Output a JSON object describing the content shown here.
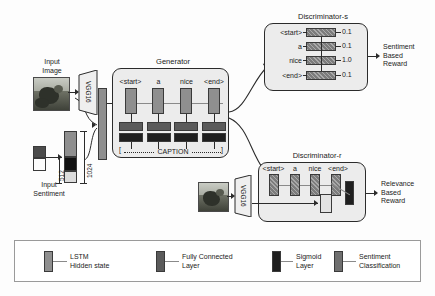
{
  "figure": {
    "background": "#fdfdfd"
  },
  "colors": {
    "lstm": "#8f8f8f",
    "fully_connected": "#5b5b5b",
    "sigmoid": "#1f1f1f",
    "sentiment_classification": "#6f6f6f",
    "module_fill": "#ececec",
    "stroke": "#2b2b2b"
  },
  "inputs": {
    "image_label": "Input\nImage",
    "sentiment_label": "Input\nSentiment",
    "vgg_label": "VGG16",
    "dim_sentiment": "512",
    "dim_image": "1024"
  },
  "generator": {
    "title": "Generator",
    "tokens": [
      "<start>",
      "a",
      "nice",
      "<end>"
    ],
    "caption_label": "CAPTION",
    "caption_bracket_left": "[",
    "caption_bracket_right": "]",
    "rows": [
      {
        "name": "lstm-hidden-state",
        "type": "lstm"
      },
      {
        "name": "fully-connected-layer",
        "type": "fc"
      },
      {
        "name": "sigmoid-layer",
        "type": "sig"
      }
    ]
  },
  "discriminator_s": {
    "title": "Discriminator-s",
    "rows": [
      {
        "token": "<start>",
        "score": "0.1"
      },
      {
        "token": "a",
        "score": "0.1"
      },
      {
        "token": "nice",
        "score": "1.0"
      },
      {
        "token": "<end>",
        "score": "0.1"
      }
    ],
    "output_label": "Sentiment\nBased\nReward"
  },
  "discriminator_r": {
    "title": "Discriminator-r",
    "tokens": [
      "<start>",
      "a",
      "nice",
      "<end>"
    ],
    "vgg_label": "VGG16",
    "output_label": "Relevance\nBased\nReward"
  },
  "legend": {
    "items": [
      {
        "swatch": "lstm",
        "label": "LSTM\nHidden state"
      },
      {
        "swatch": "fc",
        "label": "Fully Connected\nLayer"
      },
      {
        "swatch": "sig",
        "label": "Sigmoid\nLayer"
      },
      {
        "swatch": "sent",
        "label": "Sentiment\nClassification"
      }
    ]
  }
}
